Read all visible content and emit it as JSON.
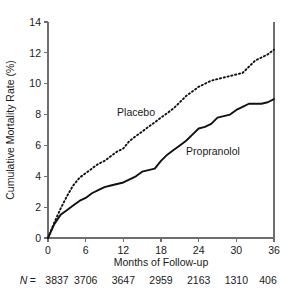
{
  "chart_data": {
    "type": "line",
    "title": "",
    "xlabel": "Months of Follow-up",
    "ylabel": "Cumulative Mortality Rate (%)",
    "xlim": [
      0,
      36
    ],
    "ylim": [
      0,
      14
    ],
    "xticks": [
      0,
      6,
      12,
      18,
      24,
      30,
      36
    ],
    "xtick_labels": [
      "0",
      "6",
      "12",
      "18",
      "24",
      "30",
      "36"
    ],
    "yticks": [
      0,
      2,
      4,
      6,
      8,
      10,
      12,
      14
    ],
    "ytick_labels": [
      "0",
      "2",
      "4",
      "6",
      "8",
      "10",
      "12",
      "14"
    ],
    "grid": false,
    "legend_position": "inline-annotation",
    "series": [
      {
        "name": "Placebo",
        "style": "dotted",
        "label_x": 11.0,
        "label_y": 7.9,
        "x": [
          0,
          1,
          2,
          3,
          4,
          5,
          6,
          7,
          8,
          9,
          10,
          11,
          12,
          13,
          14,
          15,
          16,
          17,
          18,
          19,
          20,
          21,
          22,
          23,
          24,
          25,
          26,
          27,
          28,
          29,
          30,
          31,
          32,
          33,
          34,
          35,
          36
        ],
        "values": [
          0.0,
          1.0,
          1.9,
          2.7,
          3.4,
          3.9,
          4.2,
          4.5,
          4.8,
          5.0,
          5.3,
          5.6,
          5.8,
          6.3,
          6.6,
          6.9,
          7.2,
          7.5,
          7.8,
          8.1,
          8.4,
          8.8,
          9.2,
          9.5,
          9.8,
          10.0,
          10.2,
          10.3,
          10.4,
          10.5,
          10.6,
          10.7,
          11.1,
          11.5,
          11.7,
          11.9,
          12.2
        ]
      },
      {
        "name": "Propranolol",
        "style": "solid",
        "label_x": 22.0,
        "label_y": 5.4,
        "x": [
          0,
          1,
          2,
          3,
          4,
          5,
          6,
          7,
          8,
          9,
          10,
          11,
          12,
          13,
          14,
          15,
          16,
          17,
          18,
          19,
          20,
          21,
          22,
          23,
          24,
          25,
          26,
          27,
          28,
          29,
          30,
          31,
          32,
          33,
          34,
          35,
          36
        ],
        "values": [
          0.0,
          0.9,
          1.5,
          1.8,
          2.1,
          2.4,
          2.6,
          2.9,
          3.1,
          3.3,
          3.4,
          3.5,
          3.6,
          3.8,
          4.0,
          4.3,
          4.4,
          4.5,
          5.0,
          5.4,
          5.7,
          6.0,
          6.3,
          6.7,
          7.1,
          7.2,
          7.4,
          7.8,
          7.9,
          8.0,
          8.3,
          8.5,
          8.7,
          8.7,
          8.7,
          8.8,
          9.0
        ]
      }
    ],
    "risk_table": {
      "prefix_symbol": "N",
      "prefix_equals": "=",
      "months": [
        0,
        6,
        12,
        18,
        24,
        30,
        36
      ],
      "counts": [
        "3837",
        "3706",
        "3647",
        "2959",
        "2163",
        "1310",
        "406"
      ]
    }
  }
}
